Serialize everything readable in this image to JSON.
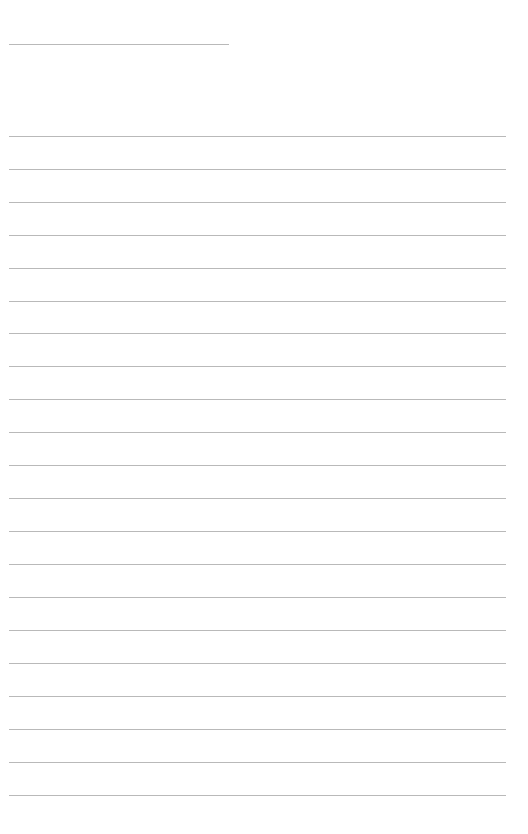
{
  "page": {
    "kind": "ruled-writing-sheet",
    "width_px": 528,
    "height_px": 834,
    "background_color": "#ffffff",
    "text_content": ""
  },
  "rules": {
    "color": "#b9b9b9",
    "thickness_px": 1,
    "header_rule": {
      "name": "header-rule",
      "x_px": 9,
      "y_px": 44,
      "width_px": 220
    },
    "body": {
      "x_px": 9,
      "width_px": 497,
      "first_y_px": 136,
      "spacing_px": 32.95,
      "count": 21,
      "lines_y_px": [
        136,
        169,
        202,
        235,
        268,
        301,
        333,
        366,
        399,
        432,
        465,
        498,
        531,
        564,
        597,
        630,
        663,
        696,
        729,
        762,
        795
      ]
    }
  }
}
